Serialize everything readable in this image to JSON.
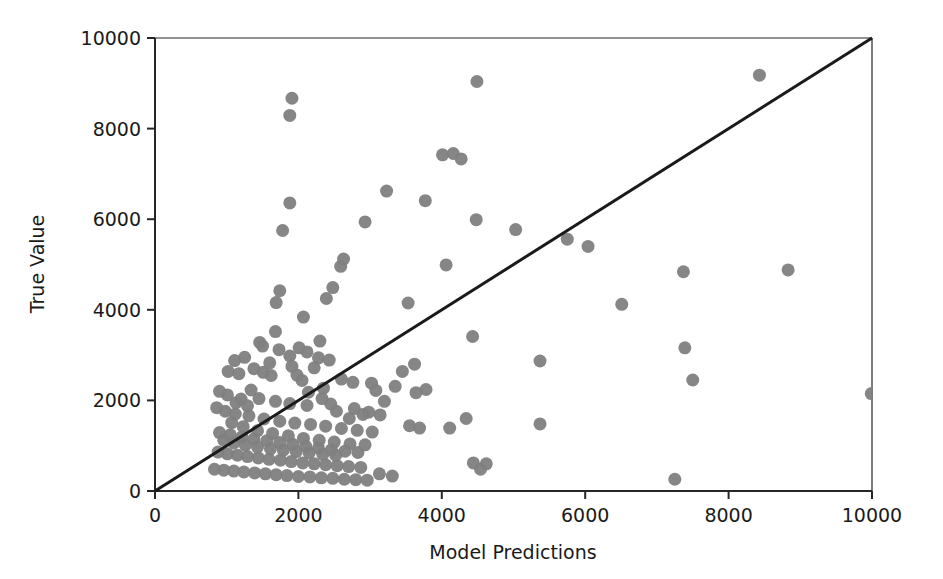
{
  "chart_data": {
    "type": "scatter",
    "title": "",
    "xlabel": "Model Predictions",
    "ylabel": "True Value",
    "xlim": [
      0,
      10000
    ],
    "ylim": [
      0,
      10000
    ],
    "xticks": [
      0,
      2000,
      4000,
      6000,
      8000,
      10000
    ],
    "yticks": [
      0,
      2000,
      4000,
      6000,
      8000,
      10000
    ],
    "xtick_labels": [
      "0",
      "2000",
      "4000",
      "6000",
      "8000",
      "10000"
    ],
    "ytick_labels": [
      "0",
      "2000",
      "4000",
      "6000",
      "8000",
      "10000"
    ],
    "grid": false,
    "legend": false,
    "marker_color": "#808080",
    "marker_size": 13,
    "marker_shape": "circle",
    "reference_line": {
      "name": "identity-line",
      "description": "y = x diagonal reference line",
      "x": [
        0,
        10000
      ],
      "y": [
        0,
        10000
      ],
      "color": "#1a1a1a",
      "width": 3
    },
    "series": [
      {
        "name": "predictions-vs-true",
        "color": "#808080",
        "points": [
          [
            1910,
            8670
          ],
          [
            1880,
            8290
          ],
          [
            4490,
            9040
          ],
          [
            8430,
            9180
          ],
          [
            4160,
            7450
          ],
          [
            4270,
            7330
          ],
          [
            4010,
            7420
          ],
          [
            3230,
            6620
          ],
          [
            3770,
            6410
          ],
          [
            1880,
            6360
          ],
          [
            4480,
            5990
          ],
          [
            2930,
            5940
          ],
          [
            5030,
            5770
          ],
          [
            5750,
            5560
          ],
          [
            6040,
            5400
          ],
          [
            1780,
            5750
          ],
          [
            2630,
            5120
          ],
          [
            2590,
            4960
          ],
          [
            4060,
            4990
          ],
          [
            8830,
            4880
          ],
          [
            7370,
            4840
          ],
          [
            2480,
            4490
          ],
          [
            2390,
            4250
          ],
          [
            1740,
            4420
          ],
          [
            1690,
            4160
          ],
          [
            3530,
            4150
          ],
          [
            6510,
            4120
          ],
          [
            2070,
            3840
          ],
          [
            1680,
            3520
          ],
          [
            4430,
            3410
          ],
          [
            7390,
            3160
          ],
          [
            2300,
            3310
          ],
          [
            1460,
            3280
          ],
          [
            1500,
            3200
          ],
          [
            1730,
            3120
          ],
          [
            2010,
            3160
          ],
          [
            2120,
            3070
          ],
          [
            1880,
            2980
          ],
          [
            2280,
            2940
          ],
          [
            2430,
            2890
          ],
          [
            5370,
            2870
          ],
          [
            1250,
            2950
          ],
          [
            1110,
            2880
          ],
          [
            3620,
            2800
          ],
          [
            3450,
            2640
          ],
          [
            7500,
            2450
          ],
          [
            1020,
            2640
          ],
          [
            1170,
            2590
          ],
          [
            1510,
            2620
          ],
          [
            1620,
            2550
          ],
          [
            1980,
            2560
          ],
          [
            2600,
            2470
          ],
          [
            2760,
            2400
          ],
          [
            3020,
            2380
          ],
          [
            3780,
            2240
          ],
          [
            3640,
            2170
          ],
          [
            2350,
            2270
          ],
          [
            2140,
            2180
          ],
          [
            1340,
            2230
          ],
          [
            1010,
            2120
          ],
          [
            1200,
            2030
          ],
          [
            1450,
            2040
          ],
          [
            1680,
            1980
          ],
          [
            1880,
            1930
          ],
          [
            2120,
            1890
          ],
          [
            2450,
            1920
          ],
          [
            2780,
            1820
          ],
          [
            2980,
            1740
          ],
          [
            3140,
            1680
          ],
          [
            4340,
            1600
          ],
          [
            5370,
            1480
          ],
          [
            9990,
            2150
          ],
          [
            860,
            1840
          ],
          [
            980,
            1760
          ],
          [
            1120,
            1700
          ],
          [
            1310,
            1660
          ],
          [
            1520,
            1590
          ],
          [
            1740,
            1540
          ],
          [
            1950,
            1500
          ],
          [
            2170,
            1470
          ],
          [
            2380,
            1430
          ],
          [
            2600,
            1380
          ],
          [
            2820,
            1340
          ],
          [
            3030,
            1300
          ],
          [
            3550,
            1440
          ],
          [
            3690,
            1390
          ],
          [
            4110,
            1390
          ],
          [
            900,
            1290
          ],
          [
            1050,
            1240
          ],
          [
            1210,
            1190
          ],
          [
            1380,
            1150
          ],
          [
            1560,
            1110
          ],
          [
            1740,
            1070
          ],
          [
            1920,
            1030
          ],
          [
            2100,
            990
          ],
          [
            2280,
            950
          ],
          [
            2460,
            910
          ],
          [
            2650,
            880
          ],
          [
            2830,
            850
          ],
          [
            880,
            860
          ],
          [
            1010,
            820
          ],
          [
            1150,
            790
          ],
          [
            1290,
            760
          ],
          [
            1440,
            730
          ],
          [
            1590,
            700
          ],
          [
            1750,
            680
          ],
          [
            1900,
            650
          ],
          [
            2060,
            620
          ],
          [
            2220,
            600
          ],
          [
            2380,
            580
          ],
          [
            2540,
            560
          ],
          [
            2700,
            540
          ],
          [
            2870,
            520
          ],
          [
            830,
            480
          ],
          [
            960,
            460
          ],
          [
            1100,
            440
          ],
          [
            1240,
            420
          ],
          [
            1390,
            400
          ],
          [
            1540,
            380
          ],
          [
            1690,
            360
          ],
          [
            1840,
            340
          ],
          [
            2000,
            320
          ],
          [
            2160,
            310
          ],
          [
            2320,
            290
          ],
          [
            2480,
            280
          ],
          [
            2640,
            260
          ],
          [
            2800,
            250
          ],
          [
            2960,
            240
          ],
          [
            3130,
            380
          ],
          [
            3310,
            330
          ],
          [
            4440,
            620
          ],
          [
            4620,
            600
          ],
          [
            4540,
            480
          ],
          [
            7250,
            260
          ],
          [
            1130,
            1950
          ],
          [
            1290,
            1880
          ],
          [
            900,
            2200
          ],
          [
            1380,
            2700
          ],
          [
            1600,
            2830
          ],
          [
            1910,
            2750
          ],
          [
            2220,
            2720
          ],
          [
            2050,
            2440
          ],
          [
            2330,
            2040
          ],
          [
            2530,
            1760
          ],
          [
            2710,
            1600
          ],
          [
            2900,
            1690
          ],
          [
            1070,
            1510
          ],
          [
            1230,
            1420
          ],
          [
            1430,
            1330
          ],
          [
            1640,
            1270
          ],
          [
            1860,
            1220
          ],
          [
            2070,
            1160
          ],
          [
            2290,
            1120
          ],
          [
            2500,
            1080
          ],
          [
            2720,
            1040
          ],
          [
            2930,
            1020
          ],
          [
            960,
            1120
          ],
          [
            1100,
            1060
          ],
          [
            1260,
            1010
          ],
          [
            1430,
            970
          ],
          [
            1610,
            930
          ],
          [
            1790,
            900
          ],
          [
            1970,
            870
          ],
          [
            2150,
            840
          ],
          [
            2340,
            810
          ],
          [
            2520,
            790
          ],
          [
            3350,
            2310
          ],
          [
            3200,
            1980
          ],
          [
            3080,
            2220
          ]
        ]
      }
    ]
  },
  "axes": {
    "plot_left_px": 155,
    "plot_right_px": 872,
    "plot_top_px": 38,
    "plot_bottom_px": 491
  }
}
